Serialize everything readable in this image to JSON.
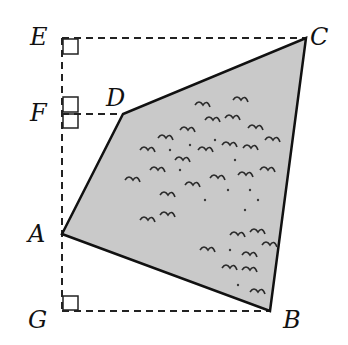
{
  "diagram": {
    "type": "geometry",
    "colors": {
      "fill": "#c9c9c9",
      "stroke": "#111111",
      "dash": "#222222",
      "shrub": "#2a2a2a"
    },
    "vertices": {
      "A": {
        "label": "A",
        "x": 62,
        "y": 234
      },
      "B": {
        "label": "B",
        "x": 270,
        "y": 311
      },
      "C": {
        "label": "C",
        "x": 306,
        "y": 38
      },
      "D": {
        "label": "D",
        "x": 123,
        "y": 114
      },
      "E": {
        "label": "E",
        "x": 62,
        "y": 38
      },
      "F": {
        "label": "F",
        "x": 62,
        "y": 114
      },
      "G": {
        "label": "G",
        "x": 62,
        "y": 311
      }
    },
    "polygon": [
      "A",
      "B",
      "C",
      "D"
    ],
    "dashed_segments": [
      [
        "E",
        "G"
      ],
      [
        "E",
        "C"
      ],
      [
        "F",
        "D"
      ],
      [
        "G",
        "B"
      ]
    ],
    "right_angle_marks": [
      "E",
      "F",
      "G"
    ]
  }
}
